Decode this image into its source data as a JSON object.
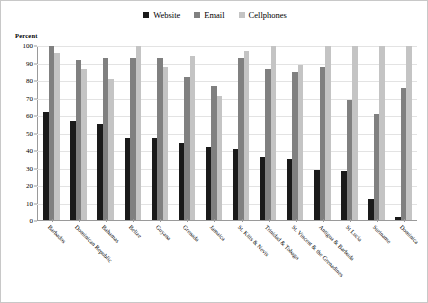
{
  "legend": {
    "position": "top-center",
    "entries": [
      {
        "label": "Website",
        "color": "#1a1a1a",
        "icon": "square-swatch-icon"
      },
      {
        "label": "Email",
        "color": "#808080",
        "icon": "square-swatch-icon"
      },
      {
        "label": "Cellphones",
        "color": "#c4c4c4",
        "icon": "square-swatch-icon"
      }
    ]
  },
  "axis": {
    "y_title": "Percent",
    "y_ticks": [
      0,
      10,
      20,
      30,
      40,
      50,
      60,
      70,
      80,
      90,
      100
    ]
  },
  "chart_data": {
    "type": "bar",
    "title": "",
    "subtitle": "",
    "xlabel": "",
    "ylabel": "Percent",
    "ylim": [
      0,
      100
    ],
    "grid": true,
    "legend_position": "top-center",
    "categories": [
      "Barbados",
      "Dominican Republic",
      "Bahamas",
      "Belize",
      "Guyana",
      "Grenada",
      "Jamaica",
      "St. Kitts & Nevis",
      "Trinidad & Tobago",
      "St. Vincent & the Grenadines",
      "Antigua & Barbuda",
      "St Lucia",
      "Suriname",
      "Dominica"
    ],
    "series": [
      {
        "name": "Website",
        "color": "#1a1a1a",
        "values": [
          62,
          57,
          55,
          47,
          47,
          44,
          42,
          41,
          36,
          35,
          29,
          28,
          12,
          2
        ]
      },
      {
        "name": "Email",
        "color": "#808080",
        "values": [
          100,
          92,
          93,
          93,
          93,
          82,
          77,
          93,
          87,
          85,
          88,
          69,
          61,
          76
        ]
      },
      {
        "name": "Cellphones",
        "color": "#c4c4c4",
        "values": [
          96,
          87,
          81,
          100,
          88,
          94,
          71,
          97,
          100,
          89,
          100,
          100,
          100,
          100
        ]
      }
    ]
  }
}
